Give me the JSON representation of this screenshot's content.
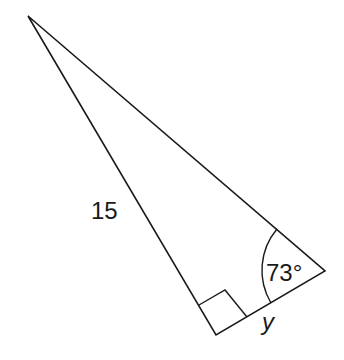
{
  "diagram": {
    "type": "right-triangle",
    "vertices": {
      "top": [
        28,
        16
      ],
      "right_angle": [
        216,
        335
      ],
      "acute": [
        325,
        271
      ]
    },
    "labels": {
      "hypotenuse": "15",
      "angle": "73°",
      "side": "y"
    },
    "stroke_color": "#1a1a1a",
    "background": "#ffffff"
  }
}
